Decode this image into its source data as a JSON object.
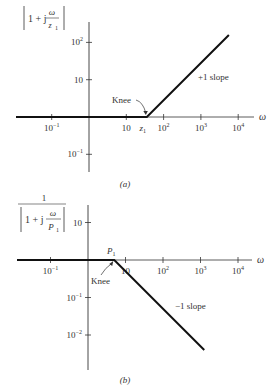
{
  "figures": [
    {
      "id": "a",
      "caption": "(a)",
      "ylabel": {
        "prefix": "1 + j",
        "num": "ω",
        "den": "z",
        "den_sub": "1"
      },
      "xaxis_symbol": "ω",
      "x_ticks": [
        {
          "label": "10",
          "sup": "−1",
          "decade": -1
        },
        {
          "label": "10",
          "sup": "",
          "decade": 1
        },
        {
          "label": "10",
          "sup": "2",
          "decade": 2
        },
        {
          "label": "10",
          "sup": "3",
          "decade": 3
        },
        {
          "label": "10",
          "sup": "4",
          "decade": 4
        }
      ],
      "y_ticks": [
        {
          "label": "10",
          "sup": "2",
          "decade": 2
        },
        {
          "label": "10",
          "sup": "",
          "decade": 1
        },
        {
          "label": "10",
          "sup": "−1",
          "decade": -1
        }
      ],
      "break_label": "z",
      "break_sub": "1",
      "break_decade": 1.55,
      "knee_label": "Knee",
      "slope_label": "+1 slope",
      "slope": 1,
      "x_range": [
        -1.9,
        4.0
      ],
      "end_decade": 3.75
    },
    {
      "id": "b",
      "caption": "(b)",
      "ylabel": {
        "top": "1",
        "prefix": "1 + j",
        "num": "ω",
        "den": "P",
        "den_sub": "1"
      },
      "xaxis_symbol": "ω",
      "x_ticks": [
        {
          "label": "10",
          "sup": "−1",
          "decade": -1
        },
        {
          "label": "10",
          "sup": "",
          "decade": 1
        },
        {
          "label": "10",
          "sup": "2",
          "decade": 2
        },
        {
          "label": "10",
          "sup": "3",
          "decade": 3
        },
        {
          "label": "10",
          "sup": "4",
          "decade": 4
        }
      ],
      "y_ticks": [
        {
          "label": "10",
          "sup": "",
          "decade": 1
        },
        {
          "label": "10",
          "sup": "−1",
          "decade": -1
        },
        {
          "label": "10",
          "sup": "−2",
          "decade": -2
        }
      ],
      "break_label": "P",
      "break_sub": "1",
      "break_decade": 0.7,
      "knee_label": "Knee",
      "slope_label": "−1 slope",
      "slope": -1,
      "x_range": [
        -1.9,
        4.0
      ],
      "end_decade": 3.1
    }
  ]
}
